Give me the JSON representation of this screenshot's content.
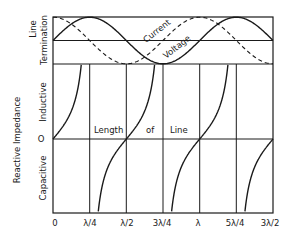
{
  "diagram": {
    "type": "transmission-line-standing-wave-and-impedance",
    "colors": {
      "ink": "#1a1a1a",
      "background": "#ffffff"
    },
    "termination_panel": {
      "label_line1": "Line",
      "label_line2": "Termination",
      "curves": [
        {
          "name": "Current",
          "style": "dashed",
          "function": "cos(2πx/λ)",
          "label": "Current"
        },
        {
          "name": "Voltage",
          "style": "solid",
          "function": "sin(2πx/λ)",
          "label": "Voltage"
        }
      ]
    },
    "impedance_panel": {
      "axis_title": "Reactive Impedance",
      "upper_label": "Inductive",
      "lower_label": "Capacitive",
      "zero_label": "O",
      "curve": {
        "style": "solid",
        "function": "tan(2πx/λ)"
      },
      "x_title_words": [
        "Length",
        "of",
        "Line"
      ]
    },
    "x_ticks": [
      "0",
      "λ/4",
      "λ/2",
      "3λ/4",
      "λ",
      "5λ/4",
      "3λ/2"
    ]
  }
}
